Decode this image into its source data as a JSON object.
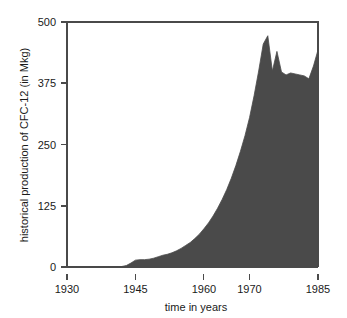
{
  "chart_data": {
    "type": "area",
    "title": "",
    "xlabel": "time in years",
    "ylabel": "historical production of CFC-12 (in Mkg)",
    "xlim": [
      1930,
      1985
    ],
    "ylim": [
      0,
      500
    ],
    "grid": false,
    "legend": null,
    "fill_color": "#4a4a4a",
    "line_color": "#4a4a4a",
    "background_color": "#ffffff",
    "axis_color": "#4a4a4a",
    "text_color": "#1a1a1a",
    "xticks": [
      1930,
      1945,
      1960,
      1970,
      1985
    ],
    "xtick_labels": [
      "1930",
      "1945",
      "1960",
      "1970",
      "1985"
    ],
    "yticks": [
      0,
      125,
      250,
      375,
      500
    ],
    "ytick_labels": [
      "0",
      "125",
      "250",
      "375",
      "500"
    ],
    "series_name": "historical production of CFC-12",
    "x": [
      1930,
      1931,
      1932,
      1933,
      1934,
      1935,
      1936,
      1937,
      1938,
      1939,
      1940,
      1941,
      1942,
      1943,
      1944,
      1945,
      1946,
      1947,
      1948,
      1949,
      1950,
      1951,
      1952,
      1953,
      1954,
      1955,
      1956,
      1957,
      1958,
      1959,
      1960,
      1961,
      1962,
      1963,
      1964,
      1965,
      1966,
      1967,
      1968,
      1969,
      1970,
      1971,
      1972,
      1973,
      1974,
      1975,
      1976,
      1977,
      1978,
      1979,
      1980,
      1981,
      1982,
      1983,
      1984,
      1985
    ],
    "values": [
      0,
      0,
      0,
      0,
      0,
      0,
      0,
      0,
      0,
      0,
      0,
      0,
      1,
      3,
      8,
      14,
      15,
      15,
      16,
      18,
      21,
      24,
      26,
      29,
      33,
      38,
      44,
      50,
      58,
      67,
      78,
      90,
      104,
      120,
      138,
      158,
      181,
      207,
      236,
      268,
      305,
      350,
      400,
      455,
      472,
      400,
      440,
      398,
      392,
      396,
      394,
      392,
      390,
      384,
      410,
      443
    ],
    "annotations": [
      {
        "text": "production begins to rise",
        "x": 1942,
        "y": 1
      },
      {
        "text": "peak production",
        "x": 1974,
        "y": 472
      },
      {
        "text": "post-peak decline and plateau",
        "x": 1980,
        "y": 394
      }
    ]
  },
  "axes": {
    "y_axis_title": "historical production of CFC-12 (in Mkg)",
    "x_axis_title": "time in years",
    "y_tick_0": "0",
    "y_tick_1": "125",
    "y_tick_2": "250",
    "y_tick_3": "375",
    "y_tick_4": "500",
    "x_tick_0": "1930",
    "x_tick_1": "1945",
    "x_tick_2": "1960",
    "x_tick_3": "1970",
    "x_tick_4": "1985"
  }
}
